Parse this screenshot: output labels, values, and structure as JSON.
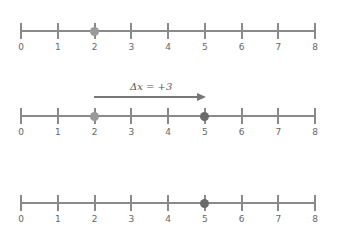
{
  "number_lines": [
    {
      "id": "initial",
      "y": 31,
      "ticks": [
        "0",
        "1",
        "2",
        "3",
        "4",
        "5",
        "6",
        "7",
        "8"
      ],
      "point": {
        "value": 2,
        "color": "#9a9a9a"
      }
    },
    {
      "id": "displacement",
      "y": 116,
      "ticks": [
        "0",
        "1",
        "2",
        "3",
        "4",
        "5",
        "6",
        "7",
        "8"
      ],
      "points": [
        {
          "value": 2,
          "color": "#9a9a9a"
        },
        {
          "value": 5,
          "color": "#6a6a6a"
        }
      ]
    },
    {
      "id": "final",
      "y": 203,
      "ticks": [
        "0",
        "1",
        "2",
        "3",
        "4",
        "5",
        "6",
        "7",
        "8"
      ],
      "point": {
        "value": 5,
        "color": "#6a6a6a"
      }
    }
  ],
  "displacement_arrow": {
    "from": 2,
    "to": 5,
    "label": "Δx = +3"
  },
  "colors": {
    "axis": "#8a8a8a",
    "initial_point": "#9a9a9a",
    "final_point": "#6a6a6a",
    "arrow": "#777777"
  }
}
